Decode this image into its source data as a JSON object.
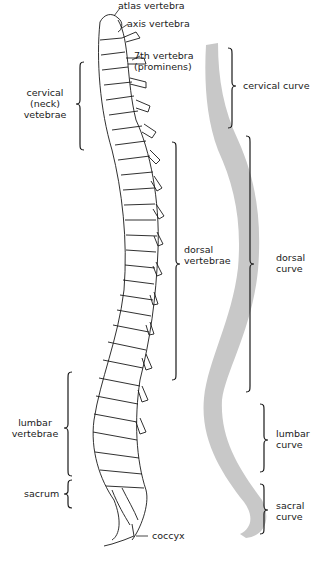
{
  "diagram": {
    "left_labels": {
      "atlas": "atlas vertebra",
      "axis": "axis vertebra",
      "seventh_line1": "7th vertebra",
      "seventh_line2": "(prominens)",
      "cervical_line1": "cervical",
      "cervical_line2": "(neck)",
      "cervical_line3": "vetebrae",
      "dorsal_line1": "dorsal",
      "dorsal_line2": "vertebrae",
      "lumbar_line1": "lumbar",
      "lumbar_line2": "vertebrae",
      "sacrum": "sacrum",
      "coccyx": "coccyx"
    },
    "curve_labels": {
      "cervical": "cervical curve",
      "dorsal_line1": "dorsal",
      "dorsal_line2": "curve",
      "lumbar_line1": "lumbar",
      "lumbar_line2": "curve",
      "sacral_line1": "sacral",
      "sacral_line2": "curve"
    },
    "colors": {
      "curve_fill": "#c8c8c8",
      "ink": "#1a1a1a"
    }
  }
}
